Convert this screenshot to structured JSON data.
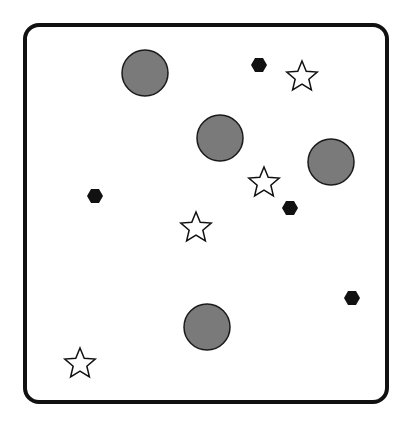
{
  "canvas": {
    "width": 413,
    "height": 427,
    "background": "#ffffff"
  },
  "frame": {
    "x": 23,
    "y": 23,
    "width": 366,
    "height": 381,
    "stroke": "#111111",
    "stroke_width": 4,
    "radius": 16
  },
  "colors": {
    "circle_fill": "#7a7a7a",
    "circle_stroke": "#1a1a1a",
    "hexagon_fill": "#111111",
    "star_fill": "#ffffff",
    "star_stroke": "#111111"
  },
  "circles": [
    {
      "cx": 145,
      "cy": 73,
      "r": 23
    },
    {
      "cx": 220,
      "cy": 138,
      "r": 23
    },
    {
      "cx": 331,
      "cy": 162,
      "r": 23
    },
    {
      "cx": 207,
      "cy": 327,
      "r": 23
    }
  ],
  "hexagons": [
    {
      "cx": 259,
      "cy": 65,
      "r": 8
    },
    {
      "cx": 95,
      "cy": 196,
      "r": 8
    },
    {
      "cx": 290,
      "cy": 208,
      "r": 8
    },
    {
      "cx": 352,
      "cy": 298,
      "r": 8
    }
  ],
  "stars": [
    {
      "cx": 302,
      "cy": 76,
      "r": 16
    },
    {
      "cx": 264,
      "cy": 182,
      "r": 16
    },
    {
      "cx": 196,
      "cy": 227,
      "r": 16
    },
    {
      "cx": 80,
      "cy": 363,
      "r": 16
    }
  ]
}
